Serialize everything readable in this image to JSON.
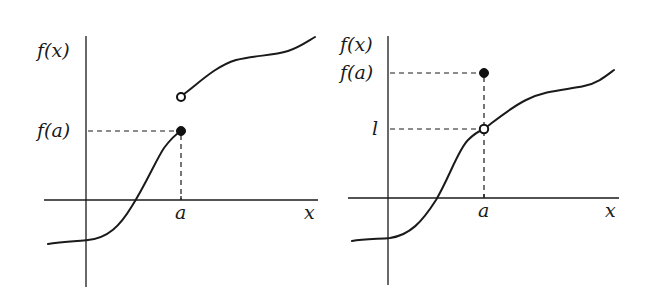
{
  "figures": [
    {
      "id": "left",
      "description": "Function with jump discontinuity at a; f(a) equals left-hand value (filled dot), open circle above",
      "labels": {
        "y_axis": "f(x)",
        "y_tick": "f(a)",
        "x_tick": "a",
        "x_axis": "x"
      },
      "points": {
        "filled": "f(a)",
        "open": "right-hand limit"
      }
    },
    {
      "id": "right",
      "description": "Function with removable discontinuity at a; limit l (open circle) differs from f(a) (filled dot)",
      "labels": {
        "y_axis": "f(x)",
        "y_tick_upper": "f(a)",
        "y_tick_lower": "l",
        "x_tick": "a",
        "x_axis": "x"
      },
      "points": {
        "filled": "f(a)",
        "open": "l"
      }
    }
  ],
  "colors": {
    "ink": "#1a1a1a",
    "background": "#ffffff"
  }
}
